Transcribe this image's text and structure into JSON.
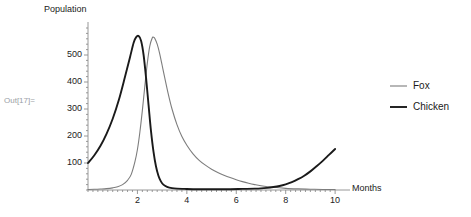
{
  "notebook": {
    "out_label": "Out[17]="
  },
  "chart_data": {
    "type": "line",
    "title": "",
    "xlabel": "Months",
    "ylabel": "Population",
    "xlim": [
      0,
      10.4
    ],
    "ylim": [
      0,
      600
    ],
    "grid": false,
    "legend_position": "right",
    "x_ticks": [
      "2",
      "4",
      "6",
      "8",
      "10"
    ],
    "x_tick_values": [
      2,
      4,
      6,
      8,
      10
    ],
    "y_ticks": [
      "100",
      "200",
      "300",
      "400",
      "500"
    ],
    "y_tick_values": [
      100,
      200,
      300,
      400,
      500
    ],
    "colors": {
      "fox": "#7d7d7d",
      "chicken": "#1a1a1a",
      "axis": "#8d8d8d",
      "text": "#222222",
      "out_label": "#9aa0a6"
    },
    "series": [
      {
        "name": "Fox",
        "color": "#7d7d7d",
        "width": 1.1,
        "x": [
          0,
          0.25,
          0.5,
          0.75,
          1,
          1.2,
          1.4,
          1.6,
          1.75,
          1.9,
          2,
          2.1,
          2.2,
          2.3,
          2.4,
          2.5,
          2.6,
          2.65,
          2.7,
          2.8,
          2.9,
          3,
          3.1,
          3.25,
          3.4,
          3.6,
          3.8,
          4,
          4.25,
          4.5,
          4.75,
          5,
          5.25,
          5.5,
          5.75,
          6,
          6.25,
          6.5,
          6.75,
          7,
          7.5,
          8,
          8.5,
          9,
          9.5,
          10
        ],
        "y": [
          2,
          2.5,
          3.5,
          5,
          8,
          12,
          20,
          36,
          58,
          105,
          150,
          215,
          295,
          385,
          470,
          533,
          563,
          566,
          562,
          540,
          505,
          462,
          418,
          355,
          300,
          242,
          198,
          166,
          134,
          110,
          92,
          77,
          65,
          55,
          46,
          38,
          31,
          25,
          20,
          16,
          10,
          6,
          4,
          3,
          2,
          2
        ]
      },
      {
        "name": "Chicken",
        "color": "#1a1a1a",
        "width": 1.9,
        "x": [
          0,
          0.25,
          0.5,
          0.75,
          1,
          1.25,
          1.5,
          1.7,
          1.85,
          1.95,
          2.05,
          2.15,
          2.25,
          2.35,
          2.45,
          2.55,
          2.65,
          2.75,
          2.85,
          2.95,
          3.05,
          3.2,
          3.4,
          3.6,
          3.9,
          4.25,
          4.75,
          5.25,
          5.75,
          6.25,
          6.75,
          7,
          7.25,
          7.5,
          7.75,
          8,
          8.25,
          8.5,
          8.75,
          9,
          9.25,
          9.5,
          9.75,
          10
        ],
        "y": [
          100,
          128,
          163,
          208,
          264,
          334,
          420,
          492,
          546,
          566,
          570,
          552,
          500,
          415,
          315,
          218,
          142,
          88,
          53,
          32,
          20,
          12,
          7,
          5,
          4,
          3,
          3,
          3,
          3,
          4,
          5,
          6,
          8,
          11,
          15,
          21,
          29,
          40,
          53,
          69,
          88,
          108,
          130,
          152
        ]
      }
    ]
  },
  "legend": {
    "items": [
      {
        "label": "Fox",
        "color": "#7d7d7d",
        "width": 1.1
      },
      {
        "label": "Chicken",
        "color": "#1a1a1a",
        "width": 1.9
      }
    ]
  }
}
